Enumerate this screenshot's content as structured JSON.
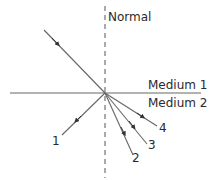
{
  "diagram": {
    "type": "refraction-ray-diagram",
    "normal_label": "Normal",
    "medium_top_label": "Medium 1",
    "medium_bottom_label": "Medium 2",
    "ray_labels": [
      "1",
      "2",
      "3",
      "4"
    ],
    "line_color": "#555555",
    "text_color": "#2a2a2a"
  }
}
